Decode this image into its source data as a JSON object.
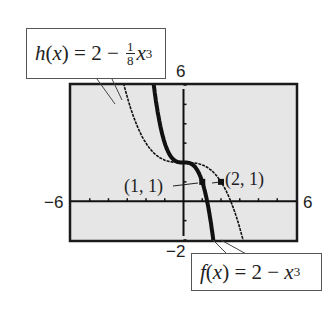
{
  "chart_data": {
    "type": "line",
    "title": "",
    "xlabel": "",
    "ylabel": "",
    "xlim": [
      -6,
      6
    ],
    "ylim": [
      -2,
      6
    ],
    "x_ticks_step": 1,
    "y_ticks_step": 1,
    "grid": false,
    "legend": "callouts",
    "window_labels": {
      "xmin": "−6",
      "xmax": "6",
      "ymin": "−2",
      "ymax": "6"
    },
    "series": [
      {
        "name": "h(x) = 2 - (1/8)x^3",
        "style": "thin dotted",
        "x": [
          -3.2,
          -3,
          -2.5,
          -2,
          -1.5,
          -1,
          -0.5,
          0,
          0.5,
          1,
          1.5,
          2,
          2.5,
          3,
          3.5
        ],
        "values": [
          6.1,
          5.375,
          3.953,
          3.0,
          2.422,
          2.125,
          2.016,
          2.0,
          1.984,
          1.875,
          1.578,
          1.0,
          0.047,
          -1.375,
          -3.359
        ]
      },
      {
        "name": "f(x) = 2 - x^3",
        "style": "thick",
        "x": [
          -1.6,
          -1.5,
          -1.25,
          -1,
          -0.75,
          -0.5,
          -0.25,
          0,
          0.25,
          0.5,
          0.75,
          1,
          1.25,
          1.5,
          1.6
        ],
        "values": [
          6.096,
          5.375,
          3.953,
          3.0,
          2.422,
          2.125,
          2.016,
          2.0,
          1.984,
          1.875,
          1.578,
          1.0,
          0.047,
          -1.375,
          -2.096
        ]
      }
    ],
    "annotations": [
      {
        "text": "(1, 1)",
        "x": 1,
        "y": 1,
        "series": "f(x) = 2 - x^3"
      },
      {
        "text": "(2, 1)",
        "x": 2,
        "y": 1,
        "series": "h(x) = 2 - (1/8)x^3"
      }
    ]
  },
  "callouts": {
    "h": {
      "fn": "h",
      "var": "x",
      "equals": " = 2 − ",
      "num": "1",
      "den": "8",
      "base": "x",
      "exp": "3"
    },
    "f": {
      "fn": "f",
      "var": "x",
      "equals": " = 2 − ",
      "base": "x",
      "exp": "3"
    }
  },
  "colors": {
    "screen_bg": "#e6e6e6",
    "frame": "#1a1a1a",
    "curve": "#111111",
    "text": "#222222"
  }
}
